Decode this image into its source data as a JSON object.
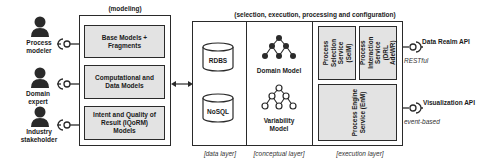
{
  "modeling": {
    "title": "(modeling)",
    "models": [
      {
        "label": "Base Models + Fragments"
      },
      {
        "label": "Computational and Data Models"
      },
      {
        "label": "Intent and Quality of Result (IQoRM) Models"
      }
    ]
  },
  "actors": [
    {
      "label": "Process modeler",
      "icon": "person-icon"
    },
    {
      "label": "Domain expert",
      "icon": "person-icon"
    },
    {
      "label": "Industry stakeholder",
      "icon": "person-icon"
    }
  ],
  "platform": {
    "title": "(selection, execution, processing and configuration)",
    "data_layer": {
      "label": "[data layer]",
      "databases": [
        {
          "label": "RDBS"
        },
        {
          "label": "NoSQL"
        }
      ]
    },
    "conceptual_layer": {
      "label": "[conceptual layer]",
      "models": [
        {
          "label": "Domain Model"
        },
        {
          "label": "Variability Model"
        }
      ]
    },
    "execution_layer": {
      "label": "[execution layer]",
      "services": [
        {
          "label": "Process Selection Service (SelM)"
        },
        {
          "label": "Process Interaction Service (DRL AdeWR)"
        },
        {
          "label": "Process Engine Service (EnM)"
        }
      ]
    }
  },
  "apis": [
    {
      "label": "Data Realm API",
      "protocol": "RESTful"
    },
    {
      "label": "Visualization API",
      "protocol": "event-based"
    }
  ]
}
